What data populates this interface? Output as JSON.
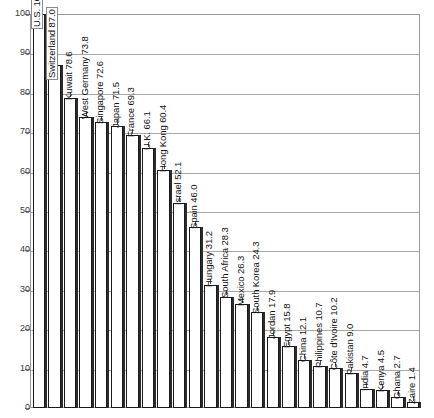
{
  "chart_data": {
    "type": "bar",
    "title": "",
    "subtitle": "",
    "xlabel": "",
    "ylabel": "",
    "ylim": [
      0,
      100
    ],
    "yticks": [
      0,
      10,
      20,
      30,
      40,
      50,
      60,
      70,
      80,
      90,
      100
    ],
    "grid": true,
    "legend": "none",
    "orientation": "vertical",
    "bar_label_rotation": -90,
    "categories": [
      "U.S.",
      "Switzerland",
      "Kuwait",
      "West Germany",
      "Singapore",
      "Japan",
      "France",
      "U.K.",
      "Hong Kong",
      "Israel",
      "Spain",
      "Hungary",
      "South Africa",
      "Mexico",
      "South Korea",
      "Jordan",
      "Egypt",
      "China",
      "Philippines",
      "Côte d'Ivoire",
      "Pakistan",
      "India",
      "Kenya",
      "Ghana",
      "Zaire"
    ],
    "values": [
      100,
      87.0,
      78.6,
      73.8,
      72.6,
      71.5,
      69.3,
      66.1,
      60.4,
      52.1,
      46.0,
      31.2,
      28.3,
      26.3,
      24.3,
      17.9,
      15.8,
      12.1,
      10.7,
      10.2,
      9.0,
      4.7,
      4.5,
      2.7,
      1.4
    ],
    "bars": [
      {
        "label": "U.S. 100",
        "category": "U.S.",
        "value": 100,
        "boxed": true
      },
      {
        "label": "Switzerland 87.0",
        "category": "Switzerland",
        "value": 87.0,
        "boxed": true
      },
      {
        "label": "Kuwait 78.6",
        "category": "Kuwait",
        "value": 78.6,
        "boxed": false
      },
      {
        "label": "West Germany 73.8",
        "category": "West Germany",
        "value": 73.8,
        "boxed": false
      },
      {
        "label": "Singapore 72.6",
        "category": "Singapore",
        "value": 72.6,
        "boxed": false
      },
      {
        "label": "Japan 71.5",
        "category": "Japan",
        "value": 71.5,
        "boxed": false
      },
      {
        "label": "France 69.3",
        "category": "France",
        "value": 69.3,
        "boxed": false
      },
      {
        "label": "U.K. 66.1",
        "category": "U.K.",
        "value": 66.1,
        "boxed": false
      },
      {
        "label": "Hong Kong 60.4",
        "category": "Hong Kong",
        "value": 60.4,
        "boxed": false
      },
      {
        "label": "Israel 52.1",
        "category": "Israel",
        "value": 52.1,
        "boxed": false
      },
      {
        "label": "Spain 46.0",
        "category": "Spain",
        "value": 46.0,
        "boxed": false
      },
      {
        "label": "Hungary 31.2",
        "category": "Hungary",
        "value": 31.2,
        "boxed": false
      },
      {
        "label": "South Africa 28.3",
        "category": "South Africa",
        "value": 28.3,
        "boxed": false
      },
      {
        "label": "Mexico 26.3",
        "category": "Mexico",
        "value": 26.3,
        "boxed": false
      },
      {
        "label": "South Korea 24.3",
        "category": "South Korea",
        "value": 24.3,
        "boxed": false
      },
      {
        "label": "Jordan 17.9",
        "category": "Jordan",
        "value": 17.9,
        "boxed": false
      },
      {
        "label": "Egypt 15.8",
        "category": "Egypt",
        "value": 15.8,
        "boxed": false
      },
      {
        "label": "China 12.1",
        "category": "China",
        "value": 12.1,
        "boxed": false
      },
      {
        "label": "Philippines 10.7",
        "category": "Philippines",
        "value": 10.7,
        "boxed": false
      },
      {
        "label": "Côte d'Ivoire 10.2",
        "category": "Côte d'Ivoire",
        "value": 10.2,
        "boxed": false
      },
      {
        "label": "Pakistan 9.0",
        "category": "Pakistan",
        "value": 9.0,
        "boxed": false
      },
      {
        "label": "India 4.7",
        "category": "India",
        "value": 4.7,
        "boxed": false
      },
      {
        "label": "Kenya 4.5",
        "category": "Kenya",
        "value": 4.5,
        "boxed": false
      },
      {
        "label": "Ghana 2.7",
        "category": "Ghana",
        "value": 2.7,
        "boxed": false
      },
      {
        "label": "Zaire 1.4",
        "category": "Zaire",
        "value": 1.4,
        "boxed": false
      }
    ],
    "colors": {
      "bar_fill": "#ffffff",
      "bar_outline": "#1a1a1a",
      "bar_shadow": "#2b2b2b",
      "gridline": "#a8a8a8",
      "plot_border": "#9a9a9a",
      "tick_label": "#3a3a3a",
      "bar_label": "#111111",
      "background": "#ffffff"
    }
  }
}
